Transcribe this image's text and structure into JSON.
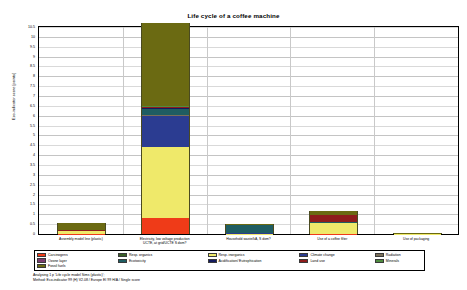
{
  "chart_data": {
    "type": "bar",
    "stacked": true,
    "title": "Life cycle of a coffee machine",
    "xlabel": "",
    "ylabel": "Eco-indicator score [points]",
    "ylim": [
      0,
      10.5
    ],
    "ytick_step": 0.5,
    "grid": true,
    "legend_position": "bottom",
    "categories": [
      "Assembly model line (plastic)",
      "Electricity, low voltage production\nUCTE, at grid/UCTE S dom?",
      "Household waste/kA, S dom?",
      "Use of a coffee filter",
      "Use of packaging"
    ],
    "yticks": [
      "10.5",
      "10",
      "9.5",
      "9",
      "8.5",
      "8",
      "7.5",
      "7",
      "6.5",
      "6",
      "5.5",
      "5",
      "4.5",
      "4",
      "3.5",
      "3",
      "2.5",
      "2",
      "1.5",
      "1",
      "0.5",
      "0"
    ],
    "series": [
      {
        "name": "Carcinogens",
        "color": "#ef3b18",
        "values": [
          0.01,
          0.8,
          0.0,
          0.02,
          0.0
        ]
      },
      {
        "name": "Resp. organics",
        "color": "#3a5f27",
        "values": [
          0.0,
          0.02,
          0.0,
          0.0,
          0.0
        ]
      },
      {
        "name": "Resp. inorganics",
        "color": "#efe96a",
        "values": [
          0.12,
          3.6,
          0.02,
          0.52,
          0.01
        ]
      },
      {
        "name": "Climate change",
        "color": "#2b3c91",
        "values": [
          0.01,
          1.55,
          0.01,
          0.03,
          0.0
        ]
      },
      {
        "name": "Radiation",
        "color": "#7a6f5a",
        "values": [
          0.0,
          0.06,
          0.0,
          0.0,
          0.0
        ]
      },
      {
        "name": "Ozone layer",
        "color": "#7a3b6e",
        "values": [
          0.0,
          0.02,
          0.0,
          0.0,
          0.0
        ]
      },
      {
        "name": "Ecotoxicity",
        "color": "#1f5d62",
        "values": [
          0.02,
          0.3,
          0.44,
          0.02,
          0.01
        ]
      },
      {
        "name": "Acidification/ Eutrophication",
        "color": "#131a5e",
        "values": [
          0.0,
          0.06,
          0.0,
          0.01,
          0.0
        ]
      },
      {
        "name": "Land use",
        "color": "#8e1c1c",
        "values": [
          0.02,
          0.05,
          0.01,
          0.38,
          0.0
        ]
      },
      {
        "name": "Minerals",
        "color": "#4f8c3f",
        "values": [
          0.0,
          0.02,
          0.0,
          0.0,
          0.0
        ]
      },
      {
        "name": "Fossil fuels",
        "color": "#6b6a12",
        "values": [
          0.37,
          4.22,
          0.02,
          0.17,
          0.02
        ]
      }
    ],
    "totals": [
      0.55,
      10.7,
      0.5,
      1.15,
      0.04
    ]
  },
  "legend": {
    "columns": [
      [
        {
          "label": "Carcinogens",
          "color": "#ef3b18"
        },
        {
          "label": "Ozone layer",
          "color": "#7a3b6e"
        },
        {
          "label": "Fossil fuels",
          "color": "#6b6a12"
        }
      ],
      [
        {
          "label": "Resp. organics",
          "color": "#3a5f27"
        },
        {
          "label": "Ecotoxicity",
          "color": "#1f5d62"
        }
      ],
      [
        {
          "label": "Resp. inorganics",
          "color": "#efe96a"
        },
        {
          "label": "Acidification/ Eutrophication",
          "color": "#131a5e"
        }
      ],
      [
        {
          "label": "Climate change",
          "color": "#2b3c91"
        },
        {
          "label": "Land use",
          "color": "#8e1c1c"
        }
      ],
      [
        {
          "label": "Radiation",
          "color": "#7a6f5a"
        },
        {
          "label": "Minerals",
          "color": "#4f8c3f"
        }
      ]
    ]
  },
  "footer": {
    "line1": "Analysing 1 p 'Life cycle model Sims (plastic)';",
    "line2": "Method: Eco-indicator 99 (H) V2.08 / Europe EI 99 H/A / Single score"
  }
}
